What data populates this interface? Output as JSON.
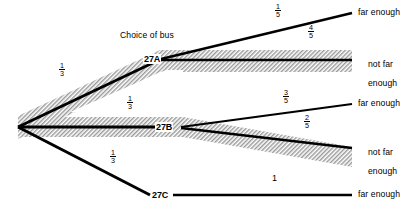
{
  "diagram": {
    "type": "probability-tree",
    "title_label": "Choice of bus",
    "root": {
      "x": 18,
      "y": 127
    },
    "nodes": [
      {
        "id": "27A",
        "label": "27A",
        "x": 160,
        "y": 59
      },
      {
        "id": "27B",
        "label": "27B",
        "x": 171,
        "y": 127
      },
      {
        "id": "27C",
        "label": "27C",
        "x": 150,
        "y": 195
      }
    ],
    "outcomes": [
      {
        "id": "a-far",
        "lines": [
          "far enough"
        ],
        "x": 358,
        "y": 12
      },
      {
        "id": "a-notfar",
        "lines": [
          "not far",
          "enough"
        ],
        "x": 358,
        "y": 53
      },
      {
        "id": "b-far",
        "lines": [
          "far enough"
        ],
        "x": 358,
        "y": 102
      },
      {
        "id": "b-notfar",
        "lines": [
          "not far",
          "enough"
        ],
        "x": 358,
        "y": 141
      },
      {
        "id": "c-far",
        "lines": [
          "far enough"
        ],
        "x": 358,
        "y": 191
      }
    ],
    "branches": [
      {
        "id": "root-27A",
        "from": "root",
        "to": "27A",
        "prob_num": "1",
        "prob_den": "3",
        "label_x": 62,
        "label_y": 66,
        "shaded": true
      },
      {
        "id": "root-27B",
        "from": "root",
        "to": "27B",
        "prob_num": "1",
        "prob_den": "3",
        "label_x": 130,
        "label_y": 99,
        "shaded": true
      },
      {
        "id": "root-27C",
        "from": "root",
        "to": "27C",
        "prob_num": "1",
        "prob_den": "3",
        "label_x": 113,
        "label_y": 153,
        "shaded": false
      },
      {
        "id": "27A-far",
        "from": "27A",
        "to": "a-far",
        "prob_num": "1",
        "prob_den": "5",
        "label_x": 278,
        "label_y": 6,
        "shaded": false
      },
      {
        "id": "27A-notfar",
        "from": "27A",
        "to": "a-notfar",
        "prob_num": "4",
        "prob_den": "5",
        "label_x": 311,
        "label_y": 27,
        "shaded": true
      },
      {
        "id": "27B-far",
        "from": "27B",
        "to": "b-far",
        "prob_num": "3",
        "prob_den": "5",
        "label_x": 286,
        "label_y": 92,
        "shaded": false
      },
      {
        "id": "27B-notfar",
        "from": "27B",
        "to": "b-notfar",
        "prob_num": "2",
        "prob_den": "5",
        "label_x": 307,
        "label_y": 117,
        "shaded": true
      },
      {
        "id": "27C-far",
        "from": "27C",
        "to": "c-far",
        "prob_whole": "1",
        "label_x": 274,
        "label_y": 176,
        "shaded": false
      }
    ],
    "colors": {
      "line": "#000000",
      "shading": "#b0b0b0",
      "background": "#ffffff",
      "text": "#000000"
    },
    "geometry": {
      "title_x": 120,
      "title_y": 36
    }
  }
}
